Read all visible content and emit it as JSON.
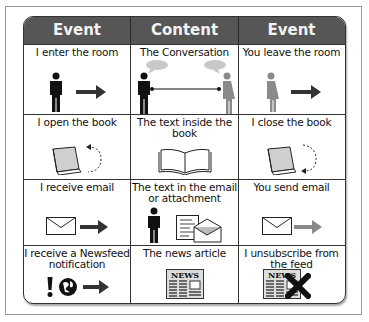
{
  "table": {
    "headers": [
      "Event",
      "Content",
      "Event"
    ],
    "rows": [
      {
        "cells": [
          {
            "label": "I enter the room",
            "icons": [
              "man-icon",
              "arrow-right-icon"
            ]
          },
          {
            "label": "The Conversation",
            "icons": [
              "man-icon",
              "speech-bubble-icon",
              "connector-line-icon",
              "speech-bubble-icon",
              "woman-icon"
            ]
          },
          {
            "label": "You leave the room",
            "icons": [
              "woman-icon",
              "arrow-right-icon"
            ]
          }
        ]
      },
      {
        "cells": [
          {
            "label": "I open the book",
            "icons": [
              "closed-book-icon",
              "dashed-curved-arrow-icon"
            ]
          },
          {
            "label": "The text inside the book",
            "icons": [
              "open-book-icon"
            ]
          },
          {
            "label": "I close the book",
            "icons": [
              "closed-book-icon",
              "dashed-curved-arrow-icon"
            ]
          }
        ]
      },
      {
        "cells": [
          {
            "label": "I receive email",
            "icons": [
              "envelope-icon",
              "arrow-right-icon"
            ]
          },
          {
            "label": "The text in the email or attachment",
            "icons": [
              "man-icon",
              "document-icon",
              "open-envelope-icon"
            ]
          },
          {
            "label": "You send email",
            "icons": [
              "envelope-icon",
              "arrow-right-icon"
            ]
          }
        ]
      },
      {
        "cells": [
          {
            "label": "I receive a Newsfeed notification",
            "icons": [
              "exclamation-icon",
              "globe-icon",
              "arrow-right-icon"
            ]
          },
          {
            "label": "The news article",
            "icons": [
              "newspaper-icon"
            ],
            "newspaper_title": "NEWS"
          },
          {
            "label": "I unsubscribe from the feed",
            "icons": [
              "newspaper-icon",
              "x-mark-icon"
            ],
            "newspaper_title": "NEWS"
          }
        ]
      }
    ]
  },
  "colors": {
    "header_bg": "#565656",
    "header_text": "#f2f2f2",
    "border": "#333333",
    "woman_figure": "#8a8a8a",
    "bubble": "#c8c8c8"
  }
}
